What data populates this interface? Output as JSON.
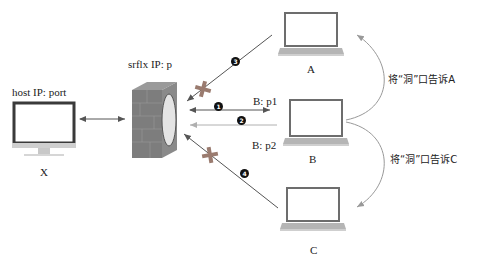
{
  "nodes": {
    "host": {
      "label": "X",
      "caption": "host IP: port"
    },
    "nat": {
      "caption": "srflx IP: p"
    },
    "peer_a": {
      "label": "A"
    },
    "peer_b": {
      "label": "B"
    },
    "peer_c": {
      "label": "C"
    }
  },
  "edges": {
    "host_nat": {
      "type": "bidirectional"
    },
    "step1": {
      "badge": "1",
      "label": "B: p1",
      "type": "bidirectional",
      "blocked": false
    },
    "step2": {
      "badge": "2",
      "type": "to-nat",
      "blocked": false
    },
    "step3": {
      "badge": "3",
      "from": "A",
      "type": "to-nat",
      "blocked": true
    },
    "step4": {
      "badge": "4",
      "from": "C",
      "type": "to-nat",
      "blocked": true
    },
    "p2_label": "B: p2"
  },
  "annotations": {
    "tell_a": "将“洞”口告诉A",
    "tell_c": "将“洞”口告诉C"
  },
  "colors": {
    "arrow": "#555555",
    "arrow_light": "#b0b0b0",
    "blocked_cross": "#9a7b6f",
    "firewall_front": "#7d7d7d",
    "firewall_top": "#9a9a9a",
    "firewall_side": "#6b6b6b",
    "hole": "#e4e4e4"
  }
}
